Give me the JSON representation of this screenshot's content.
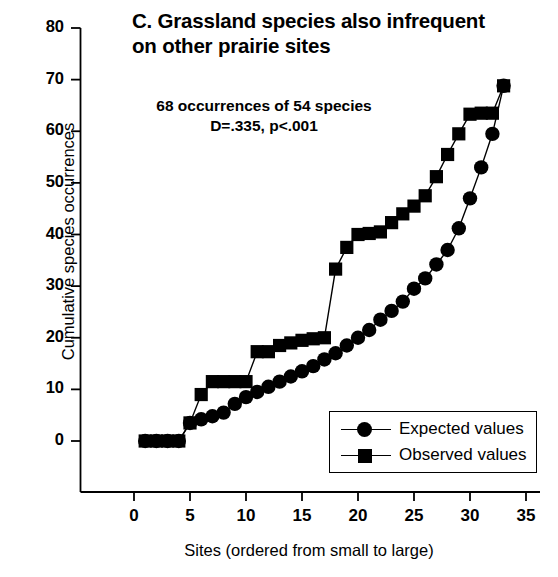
{
  "figure": {
    "panel_letter": "C.",
    "title_line1": "C. Grassland species also infrequent",
    "title_line2": "on other prairie sites",
    "annotation_line1": "68 occurrences of 54 species",
    "annotation_line2": "D=.335, p<.001",
    "background_color": "#ffffff",
    "ink_color": "#000000"
  },
  "chart_data": {
    "type": "line",
    "title": "C. Grassland species also infrequent on other prairie sites",
    "subtitle": "",
    "xlabel": "Sites (ordered from small to large)",
    "ylabel": "Cumulative species occurrences",
    "xlim": [
      -1.5,
      35.5
    ],
    "ylim": [
      0,
      80
    ],
    "xticks": [
      0,
      5,
      10,
      15,
      20,
      25,
      30,
      35
    ],
    "yticks": [
      0,
      10,
      20,
      30,
      40,
      50,
      60,
      70,
      80
    ],
    "xtick_labels": [
      "0",
      "5",
      "10",
      "15",
      "20",
      "25",
      "30",
      "35"
    ],
    "ytick_labels": [
      "0",
      "10",
      "20",
      "30",
      "40",
      "50",
      "60",
      "70",
      "80"
    ],
    "grid": false,
    "legend_position": "lower right",
    "annotations": [
      "68 occurrences of 54 species",
      "D=.335, p<.001"
    ],
    "x": [
      1,
      2,
      3,
      4,
      5,
      6,
      7,
      8,
      9,
      10,
      11,
      12,
      13,
      14,
      15,
      16,
      17,
      18,
      19,
      20,
      21,
      22,
      23,
      24,
      25,
      26,
      27,
      28,
      29,
      30,
      31,
      32,
      33
    ],
    "series": [
      {
        "name": "Expected values",
        "marker": "circle",
        "color": "#000000",
        "values": [
          0,
          0,
          0,
          0,
          3.5,
          4.2,
          4.8,
          5.5,
          7.2,
          8.5,
          9.5,
          10.5,
          11.5,
          12.5,
          13.5,
          14.5,
          15.8,
          17.0,
          18.5,
          20.0,
          21.5,
          23.5,
          25.2,
          27.0,
          29.5,
          31.5,
          34.2,
          37.0,
          41.2,
          47.0,
          53.0,
          59.5,
          68.8
        ]
      },
      {
        "name": "Observed values",
        "marker": "square",
        "color": "#000000",
        "values": [
          0,
          0,
          0,
          0,
          3.5,
          9.0,
          11.5,
          11.5,
          11.5,
          11.5,
          17.3,
          17.3,
          18.5,
          19.0,
          19.5,
          19.8,
          20.0,
          33.3,
          37.5,
          40.0,
          40.2,
          40.5,
          42.3,
          44.0,
          45.5,
          47.5,
          51.2,
          55.5,
          59.5,
          63.3,
          63.5,
          63.5,
          68.8
        ]
      }
    ]
  },
  "legend": {
    "items": [
      {
        "label": "Expected values",
        "marker": "circle"
      },
      {
        "label": "Observed values",
        "marker": "square"
      }
    ]
  }
}
